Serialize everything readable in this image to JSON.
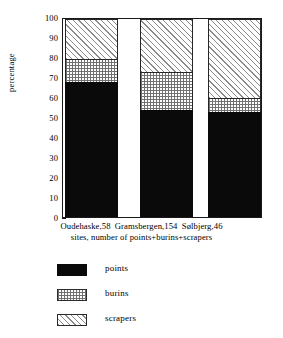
{
  "chart_data": {
    "type": "bar",
    "subtype": "stacked-bar-100",
    "title": "",
    "xlabel": "sites, number of points+burins+scrapers",
    "ylabel": "percentage",
    "categories": [
      "Oudehaske,58",
      "Gramsbergen,154",
      "Sølbjerg,46"
    ],
    "series": [
      {
        "name": "points",
        "values": [
          68,
          54,
          53
        ]
      },
      {
        "name": "burins",
        "values": [
          12,
          19,
          7
        ]
      },
      {
        "name": "scrapers",
        "values": [
          20,
          27,
          40
        ]
      }
    ],
    "ylim": [
      0,
      100
    ],
    "yticks": [
      0,
      10,
      20,
      30,
      40,
      50,
      60,
      70,
      80,
      90,
      100
    ],
    "ytick_labels": [
      "0",
      "10",
      "20",
      "30",
      "40",
      "50",
      "60",
      "70",
      "80",
      "90",
      "100"
    ],
    "grid": false,
    "legend_position": "below",
    "colors": {
      "points": "#0a0a0a",
      "burins": "#a8a8a8",
      "scrapers": "#d0d0d0",
      "axis": "#1a1a1a",
      "background": "#ffffff"
    }
  },
  "axes": {
    "y_title": "percentage",
    "ticks": [
      {
        "label": "100",
        "value": 100
      },
      {
        "label": "90",
        "value": 90
      },
      {
        "label": "80",
        "value": 80
      },
      {
        "label": "70",
        "value": 70
      },
      {
        "label": "60",
        "value": 60
      },
      {
        "label": "50",
        "value": 50
      },
      {
        "label": "40",
        "value": 40
      },
      {
        "label": "30",
        "value": 30
      },
      {
        "label": "20",
        "value": 20
      },
      {
        "label": "10",
        "value": 10
      },
      {
        "label": "0",
        "value": 0
      }
    ]
  },
  "x_axis": {
    "site_labels": [
      "Oudehaske,58",
      "Gramsbergen,154",
      "Sølbjerg,46"
    ],
    "caption": "sites, number of points+burins+scrapers"
  },
  "legend": {
    "entries": [
      {
        "label": "points",
        "key": "points"
      },
      {
        "label": "burins",
        "key": "burins"
      },
      {
        "label": "scrapers",
        "key": "scrapers"
      }
    ]
  }
}
